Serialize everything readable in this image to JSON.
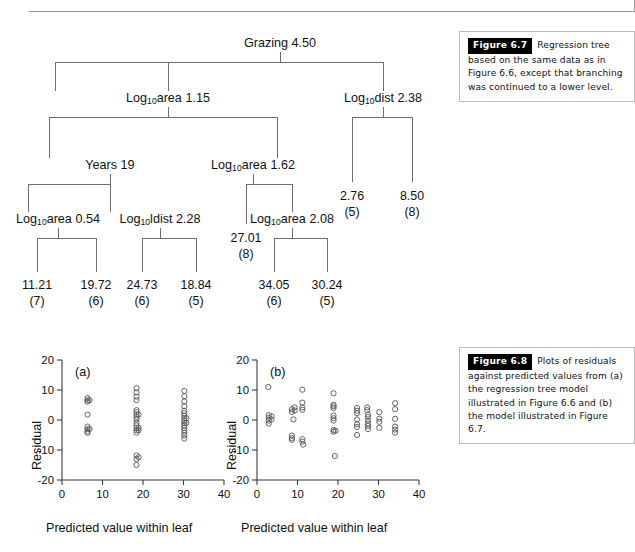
{
  "page": {
    "top_rule": true
  },
  "captions": [
    {
      "id": "figure-6-7",
      "tag": "Figure 6.7",
      "text": "Regression tree based on the same data as in Figure 6.6, except that branching was continued to a lower level."
    },
    {
      "id": "figure-6-8",
      "tag": "Figure 6.8",
      "text": "Plots of residuals against predicted values from (a) the regression tree model illustrated in Figure 6.6 and (b) the model illustrated in Figure 6.7."
    }
  ],
  "tree": {
    "title": "Regression tree",
    "split_nodes": [
      {
        "id": "root",
        "variable": "Grazing",
        "sub": "",
        "value": "4.50",
        "x": 280,
        "y": 36
      },
      {
        "id": "left-1",
        "variable": "Log",
        "sub": "10",
        "suffix": "area",
        "value": "1.15",
        "x": 168,
        "y": 91
      },
      {
        "id": "right-1",
        "variable": "Log",
        "sub": "10",
        "suffix": "dist",
        "value": "2.38",
        "x": 383,
        "y": 91
      },
      {
        "id": "left-2",
        "variable": "Years",
        "sub": "",
        "value": "19",
        "x": 110,
        "y": 158
      },
      {
        "id": "mid-2",
        "variable": "Log",
        "sub": "10",
        "suffix": "area",
        "value": "1.62",
        "x": 253,
        "y": 158
      },
      {
        "id": "left-3a",
        "variable": "Log",
        "sub": "10",
        "suffix": "area",
        "value": "0.54",
        "x": 58,
        "y": 212
      },
      {
        "id": "left-3b",
        "variable": "Log",
        "sub": "10",
        "suffix": "ldist",
        "value": "2.28",
        "x": 160,
        "y": 212
      },
      {
        "id": "mid-3",
        "variable": "Log",
        "sub": "10",
        "suffix": "area",
        "value": "2.08",
        "x": 292,
        "y": 212
      }
    ],
    "leaves": [
      {
        "id": "leaf-1",
        "value": "11.21",
        "n": "(7)",
        "x": 37,
        "y": 286
      },
      {
        "id": "leaf-2",
        "value": "19.72",
        "n": "(6)",
        "x": 96,
        "y": 286
      },
      {
        "id": "leaf-3",
        "value": "24.73",
        "n": "(6)",
        "x": 142,
        "y": 286
      },
      {
        "id": "leaf-4",
        "value": "18.84",
        "n": "(5)",
        "x": 196,
        "y": 286
      },
      {
        "id": "leaf-5",
        "value": "27.01",
        "n": "(8)",
        "x": 246,
        "y": 239
      },
      {
        "id": "leaf-6",
        "value": "34.05",
        "n": "(6)",
        "x": 274,
        "y": 286
      },
      {
        "id": "leaf-7",
        "value": "30.24",
        "n": "(5)",
        "x": 327,
        "y": 286
      },
      {
        "id": "leaf-8",
        "value": "2.76",
        "n": "(5)",
        "x": 352,
        "y": 197
      },
      {
        "id": "leaf-9",
        "value": "8.50",
        "n": "(8)",
        "x": 412,
        "y": 197
      }
    ]
  },
  "chart_data": [
    {
      "id": "plot-a",
      "type": "scatter",
      "panel_label": "(a)",
      "title": "",
      "xlabel": "Predicted value within leaf",
      "ylabel": "Residual",
      "xlim": [
        0,
        40
      ],
      "ylim": [
        -20,
        20
      ],
      "xticks": [
        0,
        10,
        20,
        30,
        40
      ],
      "yticks": [
        -20,
        -10,
        0,
        10,
        20
      ],
      "grid": false,
      "legend": "none",
      "points": [
        [
          6.3,
          7.3
        ],
        [
          6.3,
          6.6
        ],
        [
          6.3,
          6.1
        ],
        [
          6.8,
          6.6
        ],
        [
          6.3,
          1.8
        ],
        [
          6.3,
          -2.2
        ],
        [
          6.3,
          -3.0
        ],
        [
          6.3,
          -3.7
        ],
        [
          6.3,
          -4.3
        ],
        [
          6.8,
          -3.0
        ],
        [
          18.4,
          10.6
        ],
        [
          18.4,
          9.2
        ],
        [
          18.4,
          7.8
        ],
        [
          18.4,
          6.6
        ],
        [
          18.4,
          3.3
        ],
        [
          18.4,
          2.6
        ],
        [
          18.4,
          1.8
        ],
        [
          18.4,
          1.0
        ],
        [
          18.4,
          0.2
        ],
        [
          18.4,
          -1.0
        ],
        [
          18.4,
          -1.8
        ],
        [
          18.4,
          -2.6
        ],
        [
          18.4,
          -3.4
        ],
        [
          18.4,
          -4.2
        ],
        [
          18.9,
          1.8
        ],
        [
          18.9,
          -2.6
        ],
        [
          18.9,
          -3.4
        ],
        [
          18.4,
          -11.8
        ],
        [
          18.4,
          -13.0
        ],
        [
          18.4,
          -15.0
        ],
        [
          18.9,
          -12.4
        ],
        [
          30.2,
          9.7
        ],
        [
          30.2,
          7.9
        ],
        [
          30.2,
          6.2
        ],
        [
          30.2,
          4.6
        ],
        [
          30.2,
          3.0
        ],
        [
          30.2,
          2.2
        ],
        [
          30.2,
          1.4
        ],
        [
          30.2,
          0.6
        ],
        [
          30.2,
          -0.2
        ],
        [
          30.2,
          -1.0
        ],
        [
          30.2,
          -1.8
        ],
        [
          30.2,
          -2.6
        ],
        [
          30.2,
          -3.4
        ],
        [
          30.2,
          -4.3
        ],
        [
          30.2,
          -5.2
        ],
        [
          30.2,
          -6.2
        ],
        [
          30.7,
          0.6
        ],
        [
          30.7,
          -1.0
        ]
      ]
    },
    {
      "id": "plot-b",
      "type": "scatter",
      "panel_label": "(b)",
      "title": "",
      "xlabel": "Predicted value within leaf",
      "ylabel": "Residual",
      "xlim": [
        0,
        40
      ],
      "ylim": [
        -20,
        20
      ],
      "xticks": [
        0,
        10,
        20,
        30,
        40
      ],
      "yticks": [
        -20,
        -10,
        0,
        10,
        20
      ],
      "grid": false,
      "legend": "none",
      "points": [
        [
          2.8,
          11.0
        ],
        [
          2.9,
          1.6
        ],
        [
          2.9,
          0.7
        ],
        [
          2.9,
          -0.2
        ],
        [
          2.9,
          -1.2
        ],
        [
          3.6,
          1.2
        ],
        [
          3.6,
          0.2
        ],
        [
          8.6,
          3.6
        ],
        [
          8.6,
          2.7
        ],
        [
          8.6,
          -5.2
        ],
        [
          8.6,
          -6.0
        ],
        [
          8.6,
          -6.6
        ],
        [
          9.0,
          0.2
        ],
        [
          9.3,
          4.2
        ],
        [
          9.3,
          3.2
        ],
        [
          11.2,
          10.1
        ],
        [
          11.2,
          5.8
        ],
        [
          11.2,
          4.2
        ],
        [
          11.2,
          3.4
        ],
        [
          11.2,
          -6.4
        ],
        [
          11.2,
          -7.2
        ],
        [
          11.4,
          -8.2
        ],
        [
          18.9,
          8.9
        ],
        [
          18.9,
          4.6
        ],
        [
          18.9,
          4.0
        ],
        [
          18.9,
          5.1
        ],
        [
          18.9,
          1.5
        ],
        [
          18.9,
          0.6
        ],
        [
          18.9,
          -0.2
        ],
        [
          18.9,
          -3.3
        ],
        [
          18.9,
          -3.9
        ],
        [
          19.4,
          -3.6
        ],
        [
          19.2,
          -12.0
        ],
        [
          24.7,
          4.0
        ],
        [
          24.7,
          3.1
        ],
        [
          24.7,
          2.3
        ],
        [
          24.7,
          0.2
        ],
        [
          24.7,
          -1.4
        ],
        [
          24.7,
          -2.3
        ],
        [
          24.7,
          -5.0
        ],
        [
          27.2,
          4.2
        ],
        [
          27.2,
          3.3
        ],
        [
          27.4,
          1.8
        ],
        [
          27.4,
          1.0
        ],
        [
          27.4,
          -0.2
        ],
        [
          27.4,
          -1.2
        ],
        [
          27.4,
          -2.0
        ],
        [
          27.4,
          -3.0
        ],
        [
          30.2,
          2.6
        ],
        [
          30.2,
          0.4
        ],
        [
          30.2,
          -0.6
        ],
        [
          30.2,
          -2.6
        ],
        [
          34.1,
          5.6
        ],
        [
          34.1,
          3.6
        ],
        [
          34.1,
          0.4
        ],
        [
          34.1,
          -2.2
        ],
        [
          34.1,
          -3.2
        ],
        [
          34.1,
          -4.2
        ]
      ]
    }
  ]
}
